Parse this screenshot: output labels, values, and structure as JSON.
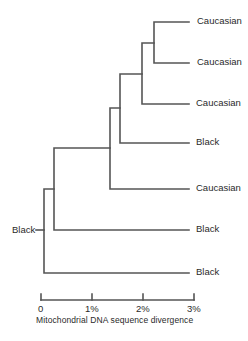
{
  "diagram": {
    "type": "phylogenetic-tree",
    "root_label": "Black",
    "leaves": [
      {
        "label": "Caucasian",
        "y": 21
      },
      {
        "label": "Caucasian",
        "y": 62
      },
      {
        "label": "Caucasian",
        "y": 103
      },
      {
        "label": "Black",
        "y": 142
      },
      {
        "label": "Caucasian",
        "y": 188
      },
      {
        "label": "Black",
        "y": 229
      },
      {
        "label": "Black",
        "y": 272
      }
    ],
    "axis": {
      "title": "Mitochondrial DNA sequence divergence",
      "ticks": [
        "0",
        "1%",
        "2%",
        "3%"
      ]
    },
    "line_color": "#555555"
  }
}
